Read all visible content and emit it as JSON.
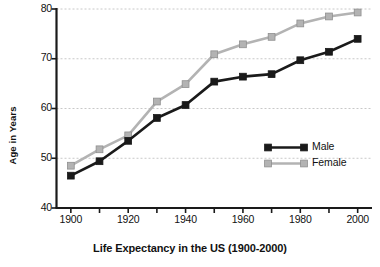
{
  "chart_data": {
    "type": "line",
    "title": "Life Expectancy in the US (1900-2000)",
    "xlabel": "",
    "ylabel": "Age in Years",
    "x": [
      1900,
      1910,
      1920,
      1930,
      1940,
      1950,
      1960,
      1970,
      1980,
      1990,
      2000
    ],
    "xtick_labels": [
      "1900",
      "1920",
      "1940",
      "1960",
      "1980",
      "2000"
    ],
    "xticks": [
      1900,
      1920,
      1940,
      1960,
      1980,
      2000
    ],
    "xminor_ticks": [
      1910,
      1930,
      1950,
      1970,
      1990
    ],
    "xlim": [
      1895,
      2005
    ],
    "ytick_labels": [
      "40",
      "50",
      "60",
      "70",
      "80"
    ],
    "yticks": [
      40,
      50,
      60,
      70,
      80
    ],
    "ylim": [
      40,
      80
    ],
    "grid": "horizontal-dashed",
    "legend_position": "inside-lower-right",
    "series": [
      {
        "name": "Male",
        "color": "#1a1a1a",
        "marker": "square",
        "values": [
          46.5,
          49.4,
          53.5,
          58.1,
          60.7,
          65.4,
          66.4,
          66.9,
          69.7,
          71.4,
          74.0
        ]
      },
      {
        "name": "Female",
        "color": "#b3b3b3",
        "marker": "square",
        "values": [
          48.5,
          51.8,
          54.6,
          61.4,
          64.9,
          70.9,
          72.9,
          74.4,
          77.1,
          78.5,
          79.3
        ]
      }
    ]
  },
  "legend": {
    "items": [
      {
        "label": "Male"
      },
      {
        "label": "Female"
      }
    ]
  },
  "colors": {
    "male": "#1a1a1a",
    "female": "#b3b3b3",
    "axis": "#1a1a1a",
    "grid": "#c8c8c8",
    "background": "#ffffff"
  }
}
